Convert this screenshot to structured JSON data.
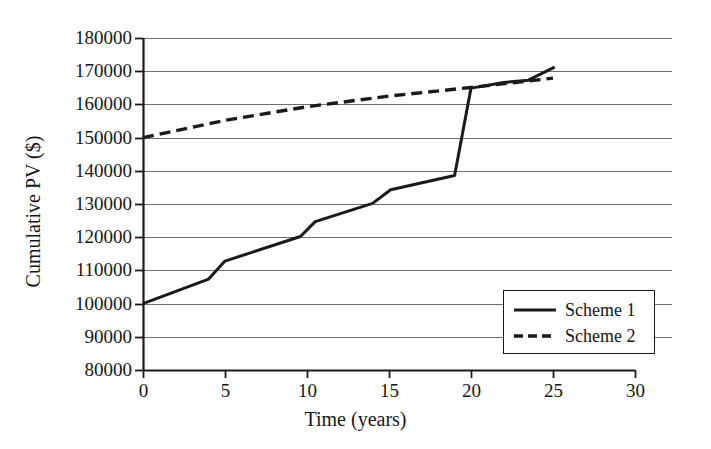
{
  "chart_data": {
    "type": "line",
    "title": "",
    "xlabel": "Time (years)",
    "ylabel": "Cumulative PV ($)",
    "xlim": [
      0,
      30
    ],
    "ylim": [
      80000,
      180000
    ],
    "xticks": [
      0,
      5,
      10,
      15,
      20,
      25,
      30
    ],
    "yticks": [
      80000,
      90000,
      100000,
      110000,
      120000,
      130000,
      140000,
      150000,
      160000,
      170000,
      180000
    ],
    "xtick_labels": [
      "0",
      "5",
      "10",
      "15",
      "20",
      "25",
      "30"
    ],
    "ytick_labels": [
      "80000",
      "90000",
      "100000",
      "110000",
      "120000",
      "130000",
      "140000",
      "150000",
      "160000",
      "170000",
      "180000"
    ],
    "grid": "horizontal",
    "legend_position": "lower right",
    "series": [
      {
        "name": "Scheme 1",
        "style": "solid",
        "color": "#1a1a1a",
        "points": [
          [
            0,
            100000
          ],
          [
            4.0,
            107400
          ],
          [
            5.0,
            112800
          ],
          [
            9.6,
            120200
          ],
          [
            10.5,
            124700
          ],
          [
            14.0,
            130200
          ],
          [
            15.1,
            134300
          ],
          [
            19.0,
            138600
          ],
          [
            20.0,
            164900
          ],
          [
            22.0,
            166600
          ],
          [
            23.5,
            167300
          ],
          [
            25.1,
            171200
          ]
        ]
      },
      {
        "name": "Scheme 2",
        "style": "dashed",
        "color": "#1a1a1a",
        "points": [
          [
            0,
            150000
          ],
          [
            5,
            155200
          ],
          [
            10,
            159300
          ],
          [
            15,
            162500
          ],
          [
            20,
            165100
          ],
          [
            25,
            167900
          ]
        ]
      }
    ]
  },
  "legend": {
    "entries": [
      {
        "label": "Scheme 1",
        "style": "solid"
      },
      {
        "label": "Scheme 2",
        "style": "dashed"
      }
    ]
  }
}
